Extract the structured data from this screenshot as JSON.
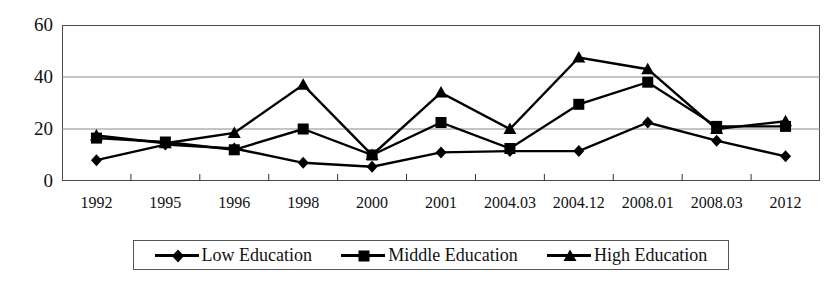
{
  "chart_data": {
    "type": "line",
    "title": "",
    "xlabel": "",
    "ylabel": "",
    "categories": [
      "1992",
      "1995",
      "1996",
      "1998",
      "2000",
      "2001",
      "2004.03",
      "2004.12",
      "2008.01",
      "2008.03",
      "2012"
    ],
    "ylim": [
      0,
      60
    ],
    "yticks": [
      0,
      20,
      40,
      60
    ],
    "ytick_labels": [
      "0",
      "20",
      "40",
      "60"
    ],
    "grid": true,
    "grid_axis": "y",
    "legend_position": "bottom",
    "series": [
      {
        "name": "Low Education",
        "marker": "diamond",
        "color": "#000000",
        "values": [
          8,
          14,
          12.5,
          7,
          5.5,
          11,
          11.5,
          11.5,
          22.5,
          15.5,
          9.5
        ]
      },
      {
        "name": "Middle Education",
        "marker": "square",
        "color": "#000000",
        "values": [
          16.5,
          15,
          12,
          20,
          10,
          22.5,
          12.5,
          29.5,
          38,
          21,
          21
        ]
      },
      {
        "name": "High Education",
        "marker": "triangle",
        "color": "#000000",
        "values": [
          17.5,
          14.5,
          18.5,
          37,
          10,
          34,
          20,
          47.5,
          43,
          20,
          23
        ]
      }
    ]
  },
  "legend": {
    "entries": [
      {
        "label": "Low Education",
        "marker": "diamond"
      },
      {
        "label": "Middle Education",
        "marker": "square"
      },
      {
        "label": "High Education",
        "marker": "triangle"
      }
    ]
  }
}
